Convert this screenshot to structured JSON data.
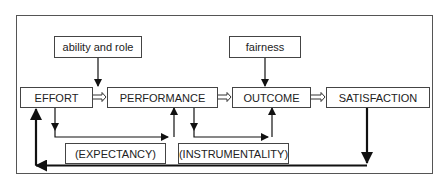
{
  "diagram": {
    "type": "flow-diagram",
    "nodes": {
      "ability_and_role": "ability and role",
      "fairness": "fairness",
      "effort": "EFFORT",
      "performance": "PERFORMANCE",
      "outcome": "OUTCOME",
      "satisfaction": "SATISFACTION",
      "expectancy": "(EXPECTANCY)",
      "instrumentality": "(INSTRUMENTALITY)"
    },
    "edges": [
      {
        "from": "effort",
        "to": "performance",
        "style": "hollow-double-arrow"
      },
      {
        "from": "performance",
        "to": "outcome",
        "style": "hollow-double-arrow"
      },
      {
        "from": "outcome",
        "to": "satisfaction",
        "style": "hollow-double-arrow"
      },
      {
        "from": "ability_and_role",
        "to": "effort-performance",
        "style": "arrow"
      },
      {
        "from": "fairness",
        "to": "outcome",
        "style": "arrow"
      },
      {
        "from": "effort",
        "to": "performance",
        "via": "expectancy",
        "style": "arrow"
      },
      {
        "from": "performance",
        "to": "outcome",
        "via": "instrumentality",
        "style": "arrow"
      },
      {
        "from": "satisfaction",
        "to": "effort",
        "style": "thick-feedback-arrow"
      }
    ],
    "colors": {
      "line": "#111111",
      "box_border": "#444444",
      "frame_border": "#555555",
      "background": "#ffffff"
    }
  }
}
